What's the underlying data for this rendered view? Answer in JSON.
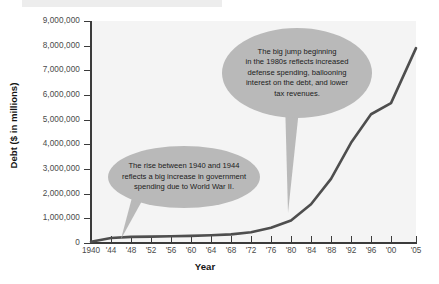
{
  "chart_data": {
    "type": "line",
    "title": "",
    "xlabel": "Year",
    "ylabel": "Debt ($ in millions)",
    "xlim": [
      1940,
      2005
    ],
    "ylim": [
      0,
      9000000
    ],
    "grid": false,
    "legend": "none",
    "y_ticks": [
      "9,000,000",
      "8,000,000",
      "7,000,000",
      "6,000,000",
      "5,000,000",
      "4,000,000",
      "3,000,000",
      "2,000,000",
      "1,000,000",
      "0"
    ],
    "y_tick_values": [
      9000000,
      8000000,
      7000000,
      6000000,
      5000000,
      4000000,
      3000000,
      2000000,
      1000000,
      0
    ],
    "x_ticks": [
      "1940",
      "'44",
      "'48",
      "'52",
      "'56",
      "'60",
      "'64",
      "'68",
      "'72",
      "'76",
      "'80",
      "'84",
      "'88",
      "'92",
      "'96",
      "'00",
      "'05"
    ],
    "x_tick_values": [
      1940,
      1944,
      1948,
      1952,
      1956,
      1960,
      1964,
      1968,
      1972,
      1976,
      1980,
      1984,
      1988,
      1992,
      1996,
      2000,
      2005
    ],
    "series": [
      {
        "name": "Debt",
        "x": [
          1940,
          1944,
          1948,
          1952,
          1956,
          1960,
          1964,
          1968,
          1972,
          1976,
          1980,
          1984,
          1988,
          1992,
          1996,
          2000,
          2005
        ],
        "values": [
          50000,
          200000,
          250000,
          260000,
          275000,
          290000,
          315000,
          350000,
          435000,
          620000,
          910000,
          1570000,
          2600000,
          4060000,
          5220000,
          5670000,
          7900000
        ]
      }
    ],
    "line_color": "#4e4e4e",
    "plot_background": "#f4f4f4",
    "axis_color": "#3b3b3b"
  },
  "annotations": [
    {
      "id": "callout-top",
      "text": "The big jump beginning\nin the 1980s reflects increased\ndefense spending, ballooning\ninterest on the debt, and lower\ntax revenues.",
      "anchor_year": 1980,
      "color": "#b9b9b9"
    },
    {
      "id": "callout-bottom",
      "text": "The rise between 1940 and 1944\nreflects a big increase in government\nspending due to World War II.",
      "anchor_year": 1942,
      "color": "#b9b9b9"
    }
  ]
}
